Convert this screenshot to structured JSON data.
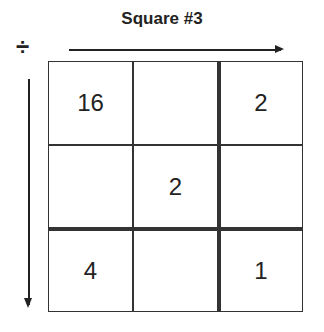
{
  "title": "Square #3",
  "operation": {
    "symbol": "÷",
    "name": "divide"
  },
  "grid": {
    "rows": 3,
    "cols": 3,
    "cells": [
      [
        "16",
        "",
        "2"
      ],
      [
        "",
        "2",
        ""
      ],
      [
        "4",
        "",
        "1"
      ]
    ],
    "thick_divider_after_col": 2,
    "thick_divider_after_row": 2
  },
  "arrows": {
    "horizontal": "right",
    "vertical": "down"
  }
}
